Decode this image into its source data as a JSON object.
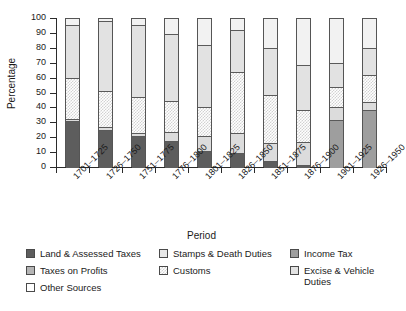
{
  "chart_data": {
    "type": "bar",
    "subtype": "stacked-100-percent",
    "title": "",
    "xlabel": "Period",
    "ylabel": "Percentage",
    "ylim": [
      0,
      100
    ],
    "ytick_values": [
      0,
      10,
      20,
      30,
      40,
      50,
      60,
      70,
      80,
      90,
      100
    ],
    "ytick_labels": [
      "0",
      "10",
      "20",
      "30",
      "40",
      "50",
      "60",
      "70",
      "80",
      "90",
      "100"
    ],
    "grid": false,
    "legend_position": "bottom",
    "categories": [
      "1701–1725",
      "1726–1750",
      "1751–1775",
      "1776–1800",
      "1801–1825",
      "1826–1850",
      "1851–1875",
      "1876–1900",
      "1901–1925",
      "1926–1950"
    ],
    "series": [
      {
        "name": "Land & Assessed Taxes",
        "color": "#5d5d5d",
        "pattern": "solid",
        "values": [
          31,
          25,
          20.5,
          17.5,
          11,
          9.5,
          4,
          1.5,
          0,
          0
        ]
      },
      {
        "name": "Income Tax",
        "color": "#9e9e9e",
        "pattern": "solid",
        "values": [
          0,
          0,
          0,
          0,
          0,
          0,
          0,
          0,
          31.5,
          38
        ]
      },
      {
        "name": "Taxes on Profits",
        "color": "#b5b5b5",
        "pattern": "solid",
        "values": [
          0,
          0,
          0,
          0,
          0,
          0,
          0,
          0,
          0,
          0
        ]
      },
      {
        "name": "Stamps & Death Duties",
        "color": "#dcdcdc",
        "pattern": "solid",
        "values": [
          1.5,
          1.5,
          2.5,
          6,
          10,
          13,
          12,
          15.5,
          8.5,
          5.5
        ]
      },
      {
        "name": "Customs",
        "color": "#d2d2d2",
        "pattern": "checker",
        "values": [
          27,
          24.5,
          24,
          20.5,
          19.5,
          41,
          32.5,
          21,
          13.5,
          18.5
        ]
      },
      {
        "name": "Excise & Vehicle Duties",
        "color": "#e2e2e2",
        "pattern": "solid",
        "values": [
          36,
          47,
          48,
          45,
          41.5,
          28.5,
          31.5,
          30.5,
          16,
          18
        ]
      },
      {
        "name": "Other Sources",
        "color": "#f2f2f2",
        "pattern": "solid",
        "values": [
          4.5,
          2,
          5,
          11,
          18,
          8,
          20,
          31.5,
          30.5,
          20
        ]
      }
    ],
    "stack_order_bottom_to_top": [
      "Land & Assessed Taxes",
      "Income Tax",
      "Taxes on Profits",
      "Stamps & Death Duties",
      "Customs",
      "Excise & Vehicle Duties",
      "Other Sources"
    ]
  },
  "axes": {
    "y_title": "Percentage",
    "x_title": "Period"
  },
  "legend": {
    "columns": [
      [
        {
          "label": "Land & Assessed Taxes",
          "color": "#5d5d5d",
          "pattern": "solid"
        },
        {
          "label": "Taxes on Profits",
          "color": "#b5b5b5",
          "pattern": "solid"
        },
        {
          "label": "Other Sources",
          "color": "#ffffff",
          "pattern": "solid"
        }
      ],
      [
        {
          "label": "Stamps & Death Duties",
          "color": "#e8e8e8",
          "pattern": "solid"
        },
        {
          "label": "Customs",
          "color": "#d2d2d2",
          "pattern": "checker"
        }
      ],
      [
        {
          "label": "Income Tax",
          "color": "#9e9e9e",
          "pattern": "solid"
        },
        {
          "label": "Excise & Vehicle Duties",
          "color": "#e2e2e2",
          "pattern": "solid"
        }
      ]
    ]
  }
}
